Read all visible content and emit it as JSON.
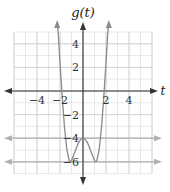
{
  "chart_data": {
    "type": "line",
    "title": "g(t)",
    "xlabel": "t",
    "ylabel": "g(t)",
    "xlim": [
      -6,
      6
    ],
    "ylim": [
      -7,
      5
    ],
    "grid": true,
    "x_ticks": [
      {
        "value": -4,
        "label": "−4"
      },
      {
        "value": -2,
        "label": "−2"
      },
      {
        "value": 2,
        "label": "2"
      },
      {
        "value": 4,
        "label": "4"
      }
    ],
    "y_ticks": [
      {
        "value": 4,
        "label": "4"
      },
      {
        "value": 2,
        "label": "2"
      },
      {
        "value": -2,
        "label": "−2"
      },
      {
        "value": -4,
        "label": "−4"
      },
      {
        "value": -6,
        "label": "−6"
      }
    ],
    "series": [
      {
        "name": "g(t)",
        "description": "quartic with local max at (0,-4) and minima near t=±1.1 at g=-6, rising steeply to arrows beyond the top",
        "x": [
          -2.2,
          -2.0,
          -1.8,
          -1.6,
          -1.4,
          -1.2,
          -1.1,
          -1.0,
          -0.8,
          -0.6,
          -0.4,
          -0.2,
          0,
          0.2,
          0.4,
          0.6,
          0.8,
          1.0,
          1.1,
          1.2,
          1.4,
          1.6,
          1.8,
          2.0,
          2.2
        ],
        "y": [
          5.6,
          2.4,
          -0.6,
          -3.2,
          -5.0,
          -5.9,
          -6.0,
          -5.9,
          -5.4,
          -4.9,
          -4.4,
          -4.1,
          -4.0,
          -4.1,
          -4.4,
          -4.9,
          -5.4,
          -5.9,
          -6.0,
          -5.9,
          -5.0,
          -3.2,
          -0.6,
          2.4,
          5.6
        ],
        "color": "#8a8a8a"
      }
    ],
    "reference_lines": [
      {
        "orientation": "horizontal",
        "y": -4,
        "color": "#b0b0b0",
        "arrows": "both"
      },
      {
        "orientation": "horizontal",
        "y": -6,
        "color": "#b0b0b0",
        "arrows": "both"
      }
    ]
  }
}
